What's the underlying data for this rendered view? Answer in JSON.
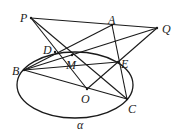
{
  "diagram": {
    "plane_label": "α",
    "points": {
      "P": {
        "label": "P",
        "x": 31,
        "y": 18,
        "lx": 20,
        "ly": 12
      },
      "A": {
        "label": "A",
        "x": 112,
        "y": 25,
        "lx": 108,
        "ly": 14
      },
      "Q": {
        "label": "Q",
        "x": 157,
        "y": 28,
        "lx": 162,
        "ly": 23
      },
      "D": {
        "label": "D",
        "x": 55,
        "y": 52,
        "lx": 43,
        "ly": 44
      },
      "M": {
        "label": "M",
        "x": 72,
        "y": 55,
        "lx": 66,
        "ly": 59
      },
      "E": {
        "label": "E",
        "x": 118,
        "y": 62,
        "lx": 121,
        "ly": 58
      },
      "B": {
        "label": "B",
        "x": 24,
        "y": 70,
        "lx": 12,
        "ly": 65
      },
      "O": {
        "label": "O",
        "x": 87,
        "y": 89,
        "lx": 81,
        "ly": 93
      },
      "C": {
        "label": "C",
        "x": 127,
        "y": 99,
        "lx": 128,
        "ly": 103
      }
    },
    "ellipse": {
      "cx": 75,
      "cy": 85,
      "rx": 58,
      "ry": 33
    },
    "segments": [
      [
        "P",
        "Q"
      ],
      [
        "P",
        "O"
      ],
      [
        "P",
        "C"
      ],
      [
        "A",
        "B"
      ],
      [
        "A",
        "C"
      ],
      [
        "Q",
        "B"
      ],
      [
        "Q",
        "E"
      ],
      [
        "O",
        "E"
      ],
      [
        "B",
        "C"
      ],
      [
        "B",
        "E"
      ]
    ],
    "stroke_color": "#1a1a1a"
  }
}
